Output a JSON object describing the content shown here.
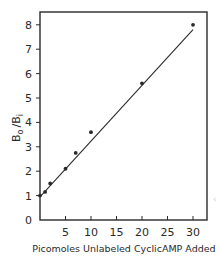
{
  "chart_data": {
    "type": "scatter",
    "title": "",
    "xlabel": "Picomoles Unlabeled CyclicAMP Added",
    "ylabel": "B",
    "ylabel_sub_numerator": "o",
    "ylabel_sub_denominator": "i",
    "ylabel_full": "Bo/Bi",
    "xlim": [
      0,
      32
    ],
    "ylim": [
      0,
      8.5
    ],
    "xticks": [
      5,
      10,
      15,
      20,
      25,
      30
    ],
    "yticks": [
      0,
      1,
      2,
      3,
      4,
      5,
      6,
      7,
      8
    ],
    "grid": false,
    "legend": null,
    "series": [
      {
        "name": "data",
        "x": [
          0,
          1,
          2,
          5,
          7,
          10,
          20,
          30
        ],
        "y": [
          1.0,
          1.15,
          1.5,
          2.1,
          2.75,
          3.6,
          5.6,
          8.0
        ]
      }
    ],
    "fit_line": {
      "x": [
        0,
        30
      ],
      "y": [
        0.95,
        7.8
      ]
    }
  },
  "axes": {
    "x_tick_labels": [
      "5",
      "10",
      "15",
      "20",
      "25",
      "30"
    ],
    "y_tick_labels": [
      "0",
      "1",
      "2",
      "3",
      "4",
      "5",
      "6",
      "7",
      "8"
    ],
    "x_title": "Picomoles Unlabeled CyclicAMP Added",
    "y_title_main": "B",
    "y_title_sub1": "o",
    "y_title_slash": "/",
    "y_title_main2": "B",
    "y_title_sub2": "i"
  },
  "colors": {
    "ink": "#2a2a2a",
    "background": "#ffffff"
  }
}
